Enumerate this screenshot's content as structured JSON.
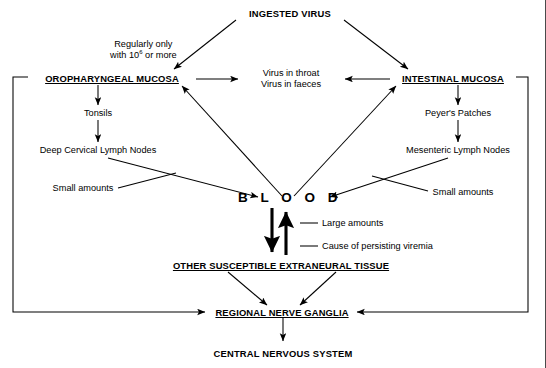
{
  "diagram": {
    "nodes": {
      "ingested_virus": "INGESTED VIRUS",
      "regularly_only": "Regularly only",
      "with_10_or_more_prefix": "with 10",
      "with_10_or_more_exponent": "6",
      "with_10_or_more_suffix": " or more",
      "oropharyngeal_mucosa": "OROPHARYNGEAL MUCOSA",
      "intestinal_mucosa": "INTESTINAL MUCOSA",
      "virus_in_throat": "Virus in throat",
      "virus_in_faeces": "Virus in faeces",
      "tonsils": "Tonsils",
      "peyers_patches": "Peyer's Patches",
      "deep_cervical_lymph_nodes": "Deep Cervical Lymph Nodes",
      "mesenteric_lymph_nodes": "Mesenteric Lymph Nodes",
      "small_amounts_left": "Small amounts",
      "small_amounts_right": "Small amounts",
      "blood": "B L O O D",
      "large_amounts": "Large amounts",
      "cause_of_persisting_viremia": "Cause of persisting viremia",
      "other_susceptible_extraneural_tissue": "OTHER SUSCEPTIBLE EXTRANEURAL TISSUE",
      "regional_nerve_ganglia": "REGIONAL NERVE GANGLIA",
      "central_nervous_system": "CENTRAL NERVOUS SYSTEM"
    },
    "colors": {
      "ink": "#000000",
      "background": "#ffffff",
      "frame": "#4a4a4a"
    }
  }
}
